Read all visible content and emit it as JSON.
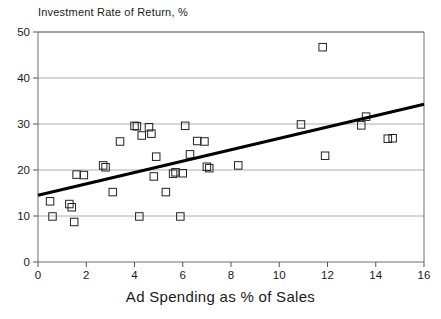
{
  "chart_data": {
    "type": "scatter",
    "title": "Investment Rate of Return, %",
    "xlabel": "Ad Spending as % of Sales",
    "ylabel": "Investment Rate of Return, %",
    "xlim": [
      0,
      16
    ],
    "ylim": [
      0,
      50
    ],
    "xticks": [
      0,
      2,
      4,
      6,
      8,
      10,
      12,
      14,
      16
    ],
    "yticks": [
      0,
      10,
      20,
      30,
      40,
      50
    ],
    "grid": "horizontal",
    "legend": "none",
    "marker": "open-square",
    "points": [
      {
        "x": 0.5,
        "y": 13.2
      },
      {
        "x": 0.6,
        "y": 9.9
      },
      {
        "x": 1.3,
        "y": 12.6
      },
      {
        "x": 1.4,
        "y": 11.9
      },
      {
        "x": 1.5,
        "y": 8.7
      },
      {
        "x": 1.6,
        "y": 19.0
      },
      {
        "x": 1.9,
        "y": 18.9
      },
      {
        "x": 2.7,
        "y": 21.0
      },
      {
        "x": 2.8,
        "y": 20.6
      },
      {
        "x": 3.1,
        "y": 15.2
      },
      {
        "x": 3.4,
        "y": 26.2
      },
      {
        "x": 4.0,
        "y": 29.6
      },
      {
        "x": 4.1,
        "y": 29.5
      },
      {
        "x": 4.2,
        "y": 9.9
      },
      {
        "x": 4.3,
        "y": 27.5
      },
      {
        "x": 4.6,
        "y": 29.3
      },
      {
        "x": 4.7,
        "y": 27.9
      },
      {
        "x": 4.8,
        "y": 18.6
      },
      {
        "x": 4.9,
        "y": 22.9
      },
      {
        "x": 5.3,
        "y": 15.2
      },
      {
        "x": 5.6,
        "y": 19.2
      },
      {
        "x": 5.7,
        "y": 19.5
      },
      {
        "x": 5.9,
        "y": 9.9
      },
      {
        "x": 6.0,
        "y": 19.3
      },
      {
        "x": 6.1,
        "y": 29.6
      },
      {
        "x": 6.3,
        "y": 23.4
      },
      {
        "x": 6.6,
        "y": 26.3
      },
      {
        "x": 6.9,
        "y": 26.2
      },
      {
        "x": 7.0,
        "y": 20.7
      },
      {
        "x": 7.1,
        "y": 20.4
      },
      {
        "x": 8.3,
        "y": 21.0
      },
      {
        "x": 10.9,
        "y": 29.9
      },
      {
        "x": 11.8,
        "y": 46.7
      },
      {
        "x": 11.9,
        "y": 23.1
      },
      {
        "x": 13.4,
        "y": 29.7
      },
      {
        "x": 13.6,
        "y": 31.6
      },
      {
        "x": 14.5,
        "y": 26.8
      },
      {
        "x": 14.7,
        "y": 26.9
      }
    ],
    "trendline": {
      "label": "linear-fit",
      "x_start": 0,
      "y_start": 14.5,
      "x_end": 16,
      "y_end": 34.3
    }
  }
}
